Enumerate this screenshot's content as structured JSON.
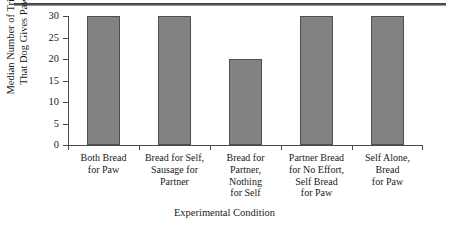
{
  "chart_data": {
    "type": "bar",
    "title": "",
    "xlabel": "Experimental Condition",
    "ylabel": "Median Number of Trials That Dog Gives Paw",
    "ylabel_lines": [
      "Median Number of Trials",
      "That Dog Gives Paw"
    ],
    "categories": [
      "Both Bread for Paw",
      "Bread for Self, Sausage for Partner",
      "Bread for Partner, Nothing for Self",
      "Partner Bread for No Effort, Self Bread for Paw",
      "Self Alone, Bread for Paw"
    ],
    "category_lines": [
      [
        "Both Bread",
        "for Paw"
      ],
      [
        "Bread for Self,",
        "Sausage for",
        "Partner"
      ],
      [
        "Bread for",
        "Partner,",
        "Nothing",
        "for Self"
      ],
      [
        "Partner Bread",
        "for No Effort,",
        "Self Bread",
        "for Paw"
      ],
      [
        "Self Alone,",
        "Bread",
        "for Paw"
      ]
    ],
    "values": [
      30,
      30,
      20,
      30,
      30
    ],
    "ylim": [
      0,
      30
    ],
    "yticks": [
      30,
      25,
      20,
      15,
      10,
      5,
      0
    ],
    "ytick_labels": [
      "30",
      "25",
      "20",
      "15",
      "10",
      "5",
      "0"
    ],
    "grid": false,
    "legend": false,
    "bar_color": "#828282",
    "bar_edge_color": "#4f4f4f",
    "axis_color": "#4a4a4a"
  }
}
